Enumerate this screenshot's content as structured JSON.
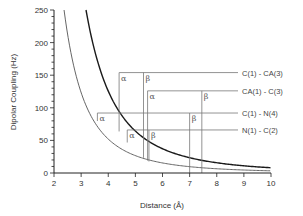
{
  "chart_data": {
    "type": "line",
    "title": "",
    "xlabel": "Distance (Å)",
    "ylabel": "Dipolar Coupling (Hz)",
    "xlim": [
      2,
      10
    ],
    "ylim": [
      0,
      250
    ],
    "xticks": [
      2,
      3,
      4,
      5,
      6,
      7,
      8,
      9,
      10
    ],
    "yticks": [
      0,
      50,
      100,
      150,
      200,
      250
    ],
    "grid": false,
    "legend": null,
    "series": [
      {
        "name": "C-C coupling curve (dark)",
        "color": "#1a1a1a",
        "formula": "D = 8040 / r^3",
        "x": [
          3.18,
          3.5,
          4,
          4.5,
          5,
          5.5,
          6,
          7,
          8,
          9,
          10
        ],
        "values": [
          250,
          188,
          126,
          88,
          64,
          48,
          37,
          23,
          16,
          11,
          8
        ]
      },
      {
        "name": "C-N coupling curve (light)",
        "color": "#666666",
        "formula": "D = 3330 / r^3",
        "x": [
          2.37,
          2.5,
          3,
          3.5,
          4,
          5,
          6,
          7,
          8,
          9,
          10
        ],
        "values": [
          250,
          213,
          123,
          78,
          52,
          27,
          15,
          10,
          6.5,
          4.6,
          3.3
        ]
      }
    ],
    "annotations": [
      {
        "label": "C(1) - CA(3)",
        "coupling_hz": 154,
        "alpha_distance": 4.4,
        "beta_distance": 5.3
      },
      {
        "label": "CA(1) - C(3)",
        "coupling_hz": 126,
        "alpha_distance": 5.45,
        "beta_distance": 7.45
      },
      {
        "label": "C(1) - N(4)",
        "coupling_hz": 92,
        "alpha_distance": 3.6,
        "beta_distance": 7.0
      },
      {
        "label": "N(1) - C(2)",
        "coupling_hz": 66,
        "alpha_distance": 4.7,
        "beta_distance": 5.5
      }
    ],
    "alpha_symbol": "α",
    "beta_symbol": "β"
  }
}
